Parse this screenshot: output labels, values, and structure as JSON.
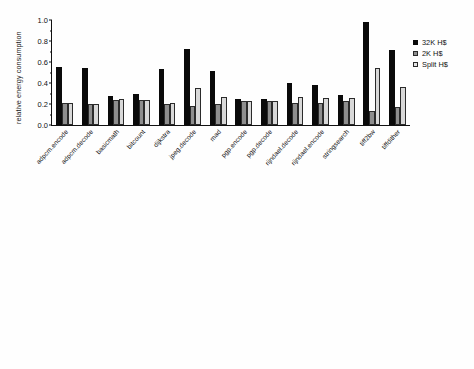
{
  "figure": {
    "background": "#ffffff",
    "series_colors": [
      "#0a0a0a",
      "#8e8e8e",
      "#d8d8d8"
    ]
  },
  "legend": {
    "entries": [
      {
        "label": "32K H$",
        "color": "#0a0a0a"
      },
      {
        "label": "2K H$",
        "color": "#8e8e8e"
      },
      {
        "label": "Split H$",
        "color": "#d8d8d8"
      }
    ]
  },
  "chart_data": [
    {
      "type": "bar",
      "title": "",
      "xlabel": "",
      "ylabel": "relative energy consumption",
      "ylim": [
        0.0,
        1.0
      ],
      "yticks": [
        "0.0",
        "0.2",
        "0.4",
        "0.6",
        "0.8",
        "1.0"
      ],
      "ytick_values": [
        0.0,
        0.2,
        0.4,
        0.6,
        0.8,
        1.0
      ],
      "grid": false,
      "legend_position": "right",
      "categories": [
        "adpcm.encode",
        "adpcm.decode",
        "basicmath",
        "bitcount",
        "dijkstra",
        "jpeg.decode",
        "mad",
        "pgp.encode",
        "pgp.decode",
        "rijndael.decode",
        "rijndael.encode",
        "stringsearch",
        "tiff2bw",
        "tiffdither"
      ],
      "series": [
        {
          "name": "32K H$",
          "values": [
            0.555,
            0.547,
            0.277,
            0.3,
            0.534,
            0.722,
            0.51,
            0.252,
            0.246,
            0.396,
            0.385,
            0.284,
            0.982,
            0.711
          ]
        },
        {
          "name": "2K H$",
          "values": [
            0.208,
            0.204,
            0.236,
            0.236,
            0.199,
            0.178,
            0.201,
            0.233,
            0.231,
            0.214,
            0.214,
            0.226,
            0.137,
            0.167
          ]
        },
        {
          "name": "Split H$",
          "values": [
            0.212,
            0.204,
            0.252,
            0.236,
            0.208,
            0.355,
            0.266,
            0.233,
            0.233,
            0.267,
            0.26,
            0.258,
            0.539,
            0.364
          ]
        }
      ]
    },
    {
      "type": "bar",
      "title": "",
      "xlabel": "",
      "ylabel": "relative execution time",
      "ylim": [
        0.0,
        1.3
      ],
      "yticks": [
        "0.0",
        "0.2",
        "0.4",
        "0.6",
        "0.8",
        "1.0",
        "1.2"
      ],
      "ytick_values": [
        0.0,
        0.2,
        0.4,
        0.6,
        0.8,
        1.0,
        1.2
      ],
      "reference_line": 1.0,
      "grid": false,
      "legend_position": "right",
      "categories": [
        "adpcm.encode",
        "adpcm.decode",
        "basicmath",
        "bitcount",
        "dijkstra",
        "jpeg.decode",
        "mad",
        "pgp.encode",
        "pgp.decode",
        "rijndael.decode",
        "rijndael.encode",
        "stringsearch",
        "tiff2bw",
        "tiffdither"
      ],
      "series": [
        {
          "name": "32K H$",
          "values": [
            0.985,
            0.985,
            0.975,
            1.0,
            0.968,
            0.917,
            0.91,
            0.985,
            0.985,
            1.01,
            0.985,
            0.965,
            0.978,
            0.94
          ]
        },
        {
          "name": "2K H$",
          "values": [
            0.94,
            0.94,
            0.975,
            0.988,
            1.062,
            0.995,
            0.902,
            0.985,
            0.985,
            1.013,
            0.998,
            0.96,
            1.052,
            1.043
          ]
        },
        {
          "name": "Split H$",
          "values": [
            0.94,
            0.937,
            0.963,
            0.988,
            1.055,
            1.043,
            0.903,
            0.982,
            0.975,
            1.01,
            1.0,
            0.962,
            1.0,
            1.035
          ]
        }
      ]
    }
  ]
}
